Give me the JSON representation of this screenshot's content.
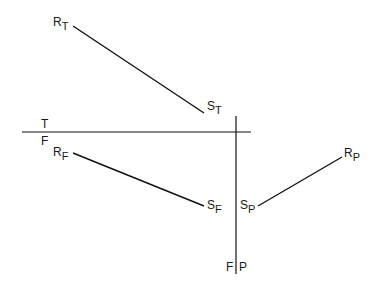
{
  "diagram": {
    "type": "orthographic projection of a line in top, front and profile views",
    "fold_lines": {
      "horizontal": {
        "top_label": "T",
        "bottom_label": "F"
      },
      "vertical": {
        "left_label": "F",
        "right_label": "P"
      }
    },
    "points": {
      "RT": {
        "main": "R",
        "sub": "T"
      },
      "ST": {
        "main": "S",
        "sub": "T"
      },
      "RF": {
        "main": "R",
        "sub": "F"
      },
      "SF": {
        "main": "S",
        "sub": "F"
      },
      "SP": {
        "main": "S",
        "sub": "P"
      },
      "RP": {
        "main": "R",
        "sub": "P"
      }
    },
    "separator": "|"
  }
}
